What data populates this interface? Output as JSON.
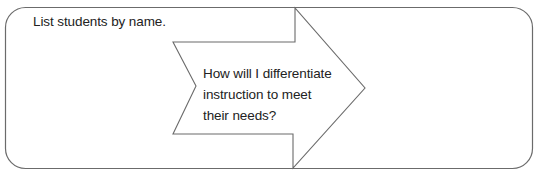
{
  "worksheet": {
    "left_prompt": "List students by name.",
    "arrow_prompt_lines": [
      "How will I differentiate",
      "instruction to meet",
      "their needs?"
    ],
    "colors": {
      "stroke": "#6b6b6b",
      "text": "#222222",
      "background": "#ffffff"
    }
  }
}
